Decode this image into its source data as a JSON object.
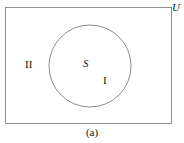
{
  "figure": {
    "caption": "(a)",
    "type": "venn-set-diagram",
    "stroke_color": "#8a8a8a",
    "text_color": "#111111",
    "background_color": "#ffffff"
  },
  "universe": {
    "label": "U",
    "shape": "rectangle",
    "x": 5,
    "y": 7,
    "width": 167,
    "height": 117
  },
  "set": {
    "label": "S",
    "shape": "circle",
    "cx": 90,
    "cy": 66,
    "r": 41
  },
  "regions": [
    {
      "label": "I",
      "meaning": "inside-set-s",
      "x": 106,
      "y": 81
    },
    {
      "label": "II",
      "meaning": "outside-set-s-inside-universe",
      "x": 31,
      "y": 65
    }
  ]
}
